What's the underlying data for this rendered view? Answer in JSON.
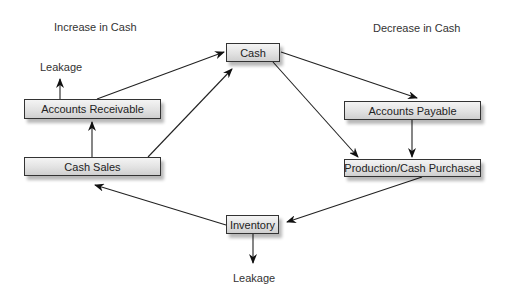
{
  "diagram": {
    "headings": {
      "increase": "Increase in Cash",
      "decrease": "Decrease in Cash"
    },
    "nodes": {
      "cash": "Cash",
      "accounts_receivable": "Accounts Receivable",
      "cash_sales": "Cash Sales",
      "accounts_payable": "Accounts Payable",
      "production": "Production/Cash Purchases",
      "inventory": "Inventory"
    },
    "leakage_labels": {
      "top": "Leakage",
      "bottom": "Leakage"
    },
    "edges": [
      {
        "from": "Accounts Receivable",
        "to": "Cash"
      },
      {
        "from": "Cash Sales",
        "to": "Cash"
      },
      {
        "from": "Cash Sales",
        "to": "Accounts Receivable"
      },
      {
        "from": "Accounts Receivable",
        "to": "Leakage"
      },
      {
        "from": "Cash",
        "to": "Accounts Payable"
      },
      {
        "from": "Cash",
        "to": "Production/Cash Purchases"
      },
      {
        "from": "Accounts Payable",
        "to": "Production/Cash Purchases"
      },
      {
        "from": "Production/Cash Purchases",
        "to": "Inventory"
      },
      {
        "from": "Inventory",
        "to": "Cash Sales"
      },
      {
        "from": "Inventory",
        "to": "Leakage"
      }
    ]
  }
}
